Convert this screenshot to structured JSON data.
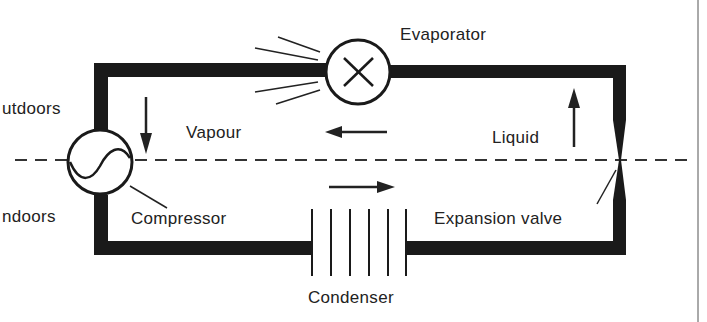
{
  "diagram": {
    "labels": {
      "evaporator": "Evaporator",
      "outdoors": "utdoors",
      "indoors": "ndoors",
      "vapour": "Vapour",
      "liquid": "Liquid",
      "compressor": "Compressor",
      "expansion_valve": "Expansion valve",
      "condenser": "Condenser"
    },
    "colors": {
      "pipe": "#1a1a1a",
      "line": "#222222",
      "background": "#ffffff"
    }
  }
}
